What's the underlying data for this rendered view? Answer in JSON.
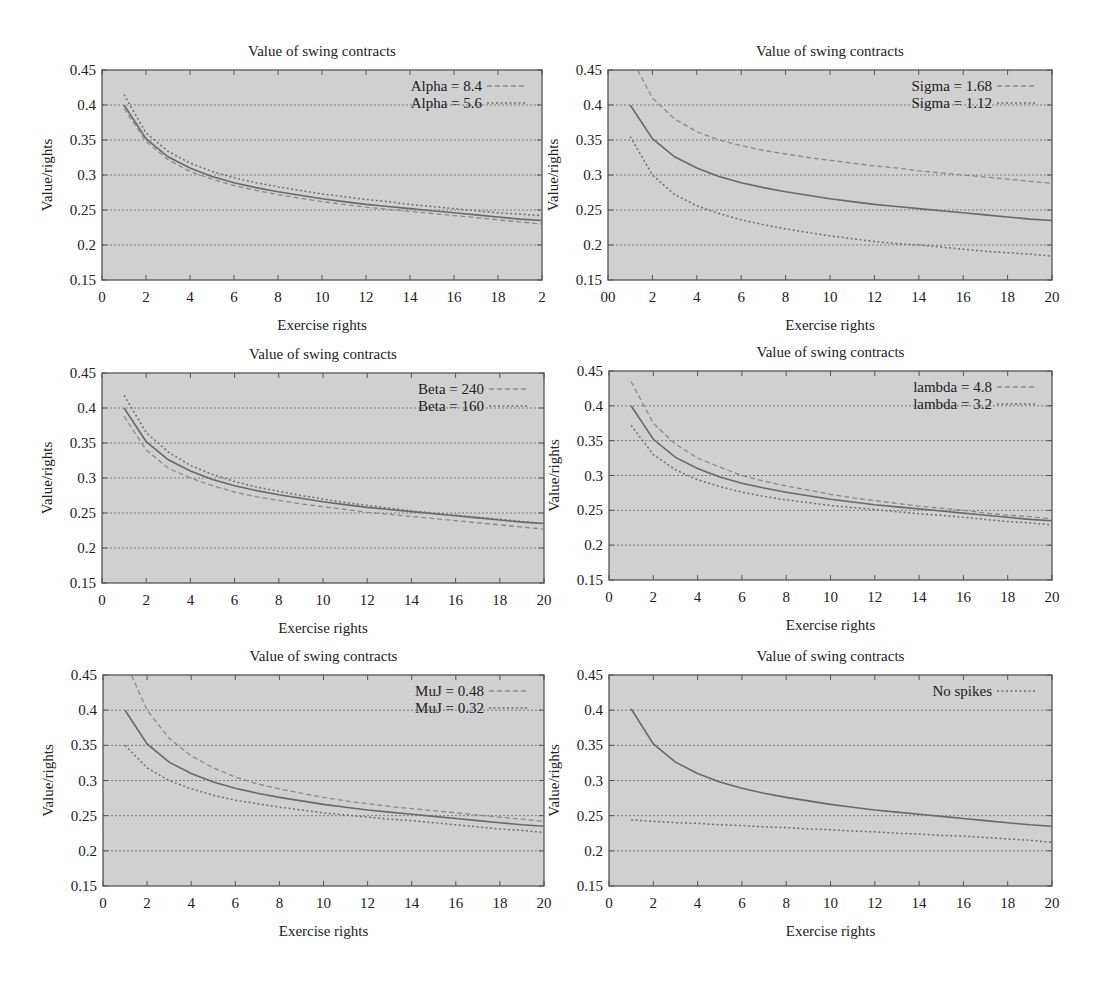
{
  "figure": {
    "panels_layout": "3 rows x 2 columns"
  },
  "chart_data": [
    {
      "id": "alpha",
      "type": "line",
      "title": "Value of swing contracts",
      "xlabel": "Exercise rights",
      "ylabel": "Value/rights",
      "xlim": [
        0,
        20
      ],
      "ylim": [
        0.15,
        0.45
      ],
      "xticks": [
        "0",
        "2",
        "4",
        "6",
        "8",
        "10",
        "12",
        "14",
        "16",
        "18",
        "2"
      ],
      "yticks": [
        "0.15",
        "0.2",
        "0.25",
        "0.3",
        "0.35",
        "0.4",
        "0.45"
      ],
      "grid": "horizontal dotted",
      "legend_position": "top-right",
      "x": [
        1,
        2,
        3,
        4,
        5,
        6,
        7,
        8,
        9,
        10,
        11,
        12,
        13,
        14,
        15,
        16,
        17,
        18,
        19,
        20
      ],
      "series": [
        {
          "name": "Base",
          "style": "solid",
          "in_legend": false,
          "values": [
            0.4,
            0.352,
            0.326,
            0.31,
            0.298,
            0.289,
            0.282,
            0.276,
            0.271,
            0.266,
            0.262,
            0.258,
            0.255,
            0.252,
            0.249,
            0.246,
            0.243,
            0.24,
            0.237,
            0.235
          ]
        },
        {
          "name": "Alpha = 8.4",
          "style": "dashed",
          "in_legend": true,
          "values": [
            0.395,
            0.348,
            0.322,
            0.305,
            0.294,
            0.285,
            0.278,
            0.272,
            0.267,
            0.262,
            0.258,
            0.254,
            0.251,
            0.248,
            0.245,
            0.242,
            0.239,
            0.236,
            0.233,
            0.23
          ]
        },
        {
          "name": "Alpha = 5.6",
          "style": "dotted",
          "in_legend": true,
          "values": [
            0.415,
            0.36,
            0.334,
            0.317,
            0.305,
            0.296,
            0.289,
            0.283,
            0.278,
            0.273,
            0.269,
            0.265,
            0.262,
            0.258,
            0.255,
            0.252,
            0.249,
            0.246,
            0.244,
            0.242
          ]
        }
      ]
    },
    {
      "id": "sigma",
      "type": "line",
      "title": "Value of swing contracts",
      "xlabel": "Exercise rights",
      "ylabel": "Value/rights",
      "xlim": [
        0,
        20
      ],
      "ylim": [
        0.15,
        0.45
      ],
      "xticks": [
        "00",
        "2",
        "4",
        "6",
        "8",
        "10",
        "12",
        "14",
        "16",
        "18",
        "20"
      ],
      "yticks": [
        "0.15",
        "0.2",
        "0.25",
        "0.3",
        "0.35",
        "0.4",
        "0.45"
      ],
      "grid": "horizontal dotted",
      "legend_position": "top-right",
      "x": [
        1,
        2,
        3,
        4,
        5,
        6,
        7,
        8,
        9,
        10,
        11,
        12,
        13,
        14,
        15,
        16,
        17,
        18,
        19,
        20
      ],
      "series": [
        {
          "name": "Base",
          "style": "solid",
          "in_legend": false,
          "values": [
            0.4,
            0.352,
            0.326,
            0.31,
            0.298,
            0.289,
            0.282,
            0.276,
            0.271,
            0.266,
            0.262,
            0.258,
            0.255,
            0.252,
            0.249,
            0.246,
            0.243,
            0.24,
            0.237,
            0.235
          ]
        },
        {
          "name": "Sigma = 1.68",
          "style": "dashed",
          "in_legend": true,
          "values": [
            0.47,
            0.41,
            0.38,
            0.362,
            0.35,
            0.342,
            0.335,
            0.33,
            0.325,
            0.321,
            0.317,
            0.313,
            0.31,
            0.306,
            0.303,
            0.3,
            0.297,
            0.294,
            0.291,
            0.288
          ]
        },
        {
          "name": "Sigma = 1.12",
          "style": "dotted",
          "in_legend": true,
          "values": [
            0.355,
            0.3,
            0.272,
            0.256,
            0.245,
            0.236,
            0.229,
            0.223,
            0.218,
            0.213,
            0.209,
            0.205,
            0.202,
            0.2,
            0.197,
            0.194,
            0.191,
            0.189,
            0.187,
            0.184
          ]
        }
      ]
    },
    {
      "id": "beta",
      "type": "line",
      "title": "Value of swing contracts",
      "xlabel": "Exercise rights",
      "ylabel": "Value/rights",
      "xlim": [
        0,
        20
      ],
      "ylim": [
        0.15,
        0.45
      ],
      "xticks": [
        "0",
        "2",
        "4",
        "6",
        "8",
        "10",
        "12",
        "14",
        "16",
        "18",
        "20"
      ],
      "yticks": [
        "0.15",
        "0.2",
        "0.25",
        "0.3",
        "0.35",
        "0.4",
        "0.45"
      ],
      "grid": "horizontal dotted",
      "legend_position": "top-right",
      "x": [
        1,
        2,
        3,
        4,
        5,
        6,
        7,
        8,
        9,
        10,
        11,
        12,
        13,
        14,
        15,
        16,
        17,
        18,
        19,
        20
      ],
      "series": [
        {
          "name": "Base",
          "style": "solid",
          "in_legend": false,
          "values": [
            0.4,
            0.352,
            0.326,
            0.31,
            0.298,
            0.289,
            0.282,
            0.276,
            0.271,
            0.266,
            0.262,
            0.258,
            0.255,
            0.252,
            0.249,
            0.246,
            0.243,
            0.24,
            0.237,
            0.235
          ]
        },
        {
          "name": "Beta = 240",
          "style": "dashed",
          "in_legend": true,
          "values": [
            0.388,
            0.34,
            0.314,
            0.3,
            0.289,
            0.28,
            0.273,
            0.268,
            0.263,
            0.259,
            0.255,
            0.251,
            0.248,
            0.245,
            0.242,
            0.239,
            0.236,
            0.233,
            0.23,
            0.227
          ]
        },
        {
          "name": "Beta = 160",
          "style": "dotted",
          "in_legend": true,
          "values": [
            0.418,
            0.365,
            0.337,
            0.318,
            0.305,
            0.295,
            0.287,
            0.281,
            0.275,
            0.27,
            0.265,
            0.261,
            0.257,
            0.253,
            0.25,
            0.247,
            0.244,
            0.241,
            0.238,
            0.235
          ]
        }
      ]
    },
    {
      "id": "lambda",
      "type": "line",
      "title": "Value of swing contracts",
      "xlabel": "Exercise rights",
      "ylabel": "Value/rights",
      "xlim": [
        0,
        20
      ],
      "ylim": [
        0.15,
        0.45
      ],
      "xticks": [
        "0",
        "2",
        "4",
        "6",
        "8",
        "10",
        "12",
        "14",
        "16",
        "18",
        "20"
      ],
      "yticks": [
        "0.15",
        "0.2",
        "0.25",
        "0.3",
        "0.35",
        "0.4",
        "0.45"
      ],
      "grid": "horizontal dotted",
      "legend_position": "top-right",
      "x": [
        1,
        2,
        3,
        4,
        5,
        6,
        7,
        8,
        9,
        10,
        11,
        12,
        13,
        14,
        15,
        16,
        17,
        18,
        19,
        20
      ],
      "series": [
        {
          "name": "Base",
          "style": "solid",
          "in_legend": false,
          "values": [
            0.4,
            0.352,
            0.326,
            0.31,
            0.298,
            0.289,
            0.282,
            0.276,
            0.271,
            0.266,
            0.262,
            0.258,
            0.255,
            0.252,
            0.249,
            0.246,
            0.243,
            0.24,
            0.237,
            0.235
          ]
        },
        {
          "name": "lambda = 4.8",
          "style": "dashed",
          "in_legend": true,
          "values": [
            0.435,
            0.375,
            0.345,
            0.325,
            0.312,
            0.3,
            0.292,
            0.285,
            0.279,
            0.273,
            0.268,
            0.264,
            0.26,
            0.256,
            0.253,
            0.25,
            0.246,
            0.243,
            0.241,
            0.238
          ]
        },
        {
          "name": "lambda = 3.2",
          "style": "dotted",
          "in_legend": true,
          "values": [
            0.372,
            0.33,
            0.308,
            0.294,
            0.284,
            0.276,
            0.27,
            0.265,
            0.261,
            0.257,
            0.254,
            0.251,
            0.248,
            0.245,
            0.243,
            0.24,
            0.237,
            0.234,
            0.232,
            0.229
          ]
        }
      ]
    },
    {
      "id": "muj",
      "type": "line",
      "title": "Value of swing contracts",
      "xlabel": "Exercise rights",
      "ylabel": "Value/rights",
      "xlim": [
        0,
        20
      ],
      "ylim": [
        0.15,
        0.45
      ],
      "xticks": [
        "0",
        "2",
        "4",
        "6",
        "8",
        "10",
        "12",
        "14",
        "16",
        "18",
        "20"
      ],
      "yticks": [
        "0.15",
        "0.2",
        "0.25",
        "0.3",
        "0.35",
        "0.4",
        "0.45"
      ],
      "grid": "horizontal dotted",
      "legend_position": "top-right",
      "x": [
        1,
        2,
        3,
        4,
        5,
        6,
        7,
        8,
        9,
        10,
        11,
        12,
        13,
        14,
        15,
        16,
        17,
        18,
        19,
        20
      ],
      "series": [
        {
          "name": "Base",
          "style": "solid",
          "in_legend": false,
          "values": [
            0.4,
            0.352,
            0.326,
            0.31,
            0.298,
            0.289,
            0.282,
            0.276,
            0.271,
            0.266,
            0.262,
            0.258,
            0.255,
            0.252,
            0.249,
            0.246,
            0.243,
            0.24,
            0.237,
            0.235
          ]
        },
        {
          "name": "MuJ = 0.48",
          "style": "dashed",
          "in_legend": true,
          "values": [
            0.47,
            0.4,
            0.36,
            0.335,
            0.318,
            0.305,
            0.295,
            0.288,
            0.282,
            0.276,
            0.271,
            0.267,
            0.263,
            0.26,
            0.257,
            0.254,
            0.251,
            0.248,
            0.245,
            0.242
          ]
        },
        {
          "name": "MuJ = 0.32",
          "style": "dotted",
          "in_legend": true,
          "values": [
            0.35,
            0.318,
            0.3,
            0.288,
            0.279,
            0.272,
            0.267,
            0.262,
            0.258,
            0.254,
            0.251,
            0.248,
            0.245,
            0.243,
            0.24,
            0.237,
            0.234,
            0.231,
            0.229,
            0.226
          ]
        }
      ]
    },
    {
      "id": "nospikes",
      "type": "line",
      "title": "Value of swing contracts",
      "xlabel": "Exercise rights",
      "ylabel": "Value/rights",
      "xlim": [
        0,
        20
      ],
      "ylim": [
        0.15,
        0.45
      ],
      "xticks": [
        "0",
        "2",
        "4",
        "6",
        "8",
        "10",
        "12",
        "14",
        "16",
        "18",
        "20"
      ],
      "yticks": [
        "0.15",
        "0.2",
        "0.25",
        "0.3",
        "0.35",
        "0.4",
        "0.45"
      ],
      "grid": "horizontal dotted",
      "legend_position": "top-right",
      "x": [
        1,
        2,
        3,
        4,
        5,
        6,
        7,
        8,
        9,
        10,
        11,
        12,
        13,
        14,
        15,
        16,
        17,
        18,
        19,
        20
      ],
      "series": [
        {
          "name": "Base",
          "style": "solid",
          "in_legend": false,
          "values": [
            0.402,
            0.352,
            0.326,
            0.31,
            0.298,
            0.289,
            0.282,
            0.276,
            0.271,
            0.266,
            0.262,
            0.258,
            0.255,
            0.252,
            0.249,
            0.246,
            0.243,
            0.24,
            0.237,
            0.235
          ]
        },
        {
          "name": "No spikes",
          "style": "dotted",
          "in_legend": true,
          "values": [
            0.244,
            0.242,
            0.24,
            0.239,
            0.237,
            0.236,
            0.234,
            0.233,
            0.231,
            0.23,
            0.228,
            0.227,
            0.225,
            0.224,
            0.222,
            0.221,
            0.219,
            0.217,
            0.215,
            0.212
          ]
        }
      ]
    }
  ]
}
